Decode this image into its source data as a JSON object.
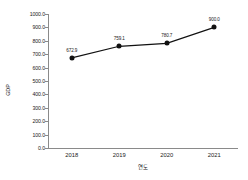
{
  "chart_data": {
    "type": "line",
    "title": "",
    "xlabel": "연도",
    "ylabel": "GDP",
    "categories": [
      "2018",
      "2019",
      "2020",
      "2021"
    ],
    "values": [
      672.9,
      759.1,
      780.7,
      900.0
    ],
    "point_labels": [
      "672.9",
      "759.1",
      "780.7",
      "900.0"
    ],
    "series": [
      {
        "name": "GDP",
        "values": [
          672.9,
          759.1,
          780.7,
          900.0
        ]
      }
    ],
    "ylim": [
      0.0,
      1000.0
    ],
    "ytick_labels": [
      "1000.0",
      "900.0",
      "800.0",
      "700.0",
      "600.0",
      "500.0",
      "400.0",
      "300.0",
      "200.0",
      "100.0",
      "0.0"
    ],
    "ytick_values": [
      1000.0,
      900.0,
      800.0,
      700.0,
      600.0,
      500.0,
      400.0,
      300.0,
      200.0,
      100.0,
      0.0
    ],
    "xtick_labels": [
      "2018",
      "2019",
      "2020",
      "2021"
    ],
    "grid": false,
    "legend": null,
    "colors": {
      "line": "#111111",
      "marker": "#111111",
      "axis": "#8a8a8a",
      "text": "#1a1a1a",
      "background": "#ffffff"
    }
  }
}
